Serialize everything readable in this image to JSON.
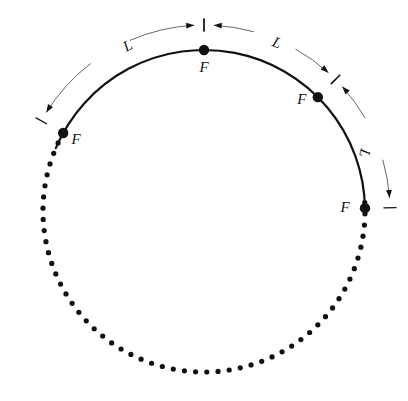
{
  "figure": {
    "background_color": "#ffffff",
    "ink_color": "#111111",
    "thin_color": "#555555",
    "geometry": {
      "center_x": 204,
      "center_y": 211,
      "radius": 161,
      "dot_radius": 2.6,
      "marker_radius": 5.2,
      "dotted_step_degrees": 4.0,
      "solid_arc_start_degrees": 209,
      "solid_arc_end_degrees": 353,
      "dim_arc_radius": 186
    },
    "points": [
      {
        "id": "point-f-left",
        "label": "F",
        "angle_degrees": 209,
        "label_dx": 13,
        "label_dy": 11
      },
      {
        "id": "point-f-top",
        "label": "F",
        "angle_degrees": 270,
        "label_dx": 0,
        "label_dy": 22
      },
      {
        "id": "point-f-right-upper",
        "label": "F",
        "angle_degrees": 315,
        "label_dx": -16,
        "label_dy": 7
      },
      {
        "id": "point-f-right-lower",
        "label": "F",
        "angle_degrees": 359,
        "label_dx": -20,
        "label_dy": 4
      }
    ],
    "dimensions": [
      {
        "id": "dimension-l-left",
        "label": "L",
        "start_degrees": 209,
        "end_degrees": 270,
        "label_x": 130,
        "label_y": 50,
        "label_rotation": -28
      },
      {
        "id": "dimension-l-top-right",
        "label": "L",
        "start_degrees": 270,
        "end_degrees": 315,
        "label_x": 275,
        "label_y": 47,
        "label_rotation": 22
      },
      {
        "id": "dimension-l-right-lower",
        "label": "L",
        "start_degrees": 315,
        "end_degrees": 359,
        "label_x": 360,
        "label_y": 152,
        "label_rotation": 103
      }
    ],
    "label_font_size": 15
  }
}
